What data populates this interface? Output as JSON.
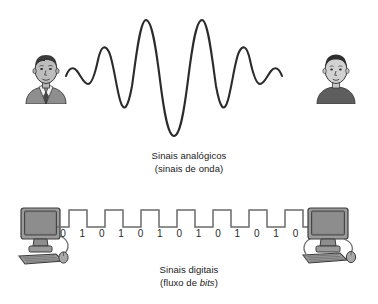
{
  "figure": {
    "background_color": "#ffffff",
    "stroke_color": "#2b2b2b",
    "text_color": "#1a1a1a"
  },
  "analog": {
    "caption_line1": "Sinais analógicos",
    "caption_line2": "(sinais de onda)",
    "left_figure_name": "person-with-tie",
    "right_figure_name": "person-plain",
    "wave_label": "analog-sine-wave",
    "wave_description": "amplitude-modulated continuous sine wave"
  },
  "digital": {
    "caption_line1": "Sinais digitais",
    "caption_line2_prefix": "(fluxo de ",
    "caption_line2_emphasis": "bits",
    "caption_line2_suffix": ")",
    "left_device_name": "desktop-computer",
    "right_device_name": "desktop-computer",
    "wave_label": "digital-square-wave",
    "pulse_count": 7,
    "bits": [
      "0",
      "1",
      "0",
      "1",
      "0",
      "1",
      "0",
      "1",
      "0",
      "1",
      "0",
      "1",
      "0",
      "1"
    ]
  }
}
